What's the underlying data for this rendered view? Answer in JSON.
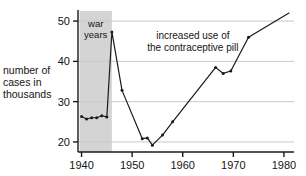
{
  "chart_data": {
    "type": "line",
    "title": "",
    "xlabel": "",
    "ylabel": "number of cases in thousands",
    "ylabel_lines": [
      "number of",
      "cases in",
      "thousands"
    ],
    "xlim": [
      1939.3,
      1981.2
    ],
    "ylim": [
      17.5,
      52.5
    ],
    "xticks": [
      1940,
      1950,
      1960,
      1970,
      1980
    ],
    "xticklabels": [
      "1940",
      "1950",
      "1960",
      "1970",
      "1980"
    ],
    "yticks": [
      20,
      30,
      40,
      50
    ],
    "yticklabels": [
      "20",
      "30",
      "40",
      "50"
    ],
    "grid": "horizontal",
    "legend": "none",
    "markers": true,
    "x": [
      1940,
      1941,
      1942,
      1943,
      1944,
      1945,
      1946,
      1948,
      1952,
      1953,
      1954,
      1956,
      1958,
      1966.5,
      1968,
      1969.5,
      1973,
      1981
    ],
    "values": [
      26.3,
      25.7,
      26.0,
      26.0,
      26.5,
      26.2,
      47.3,
      32.8,
      20.8,
      21.0,
      19.2,
      21.7,
      25.0,
      38.5,
      37.0,
      37.6,
      46.0,
      52.0
    ],
    "annotations": [
      {
        "name": "war-years",
        "lines": [
          "war",
          "years"
        ],
        "x_start": 1939.6,
        "x_end": 1946.0,
        "shading": "#d4d4d4"
      },
      {
        "name": "contraceptive-pill",
        "lines": [
          "increased use of",
          "the contraceptive pill"
        ],
        "x": 1962,
        "y": 45.5
      }
    ],
    "colors": {
      "line": "#1a1a1a",
      "marker": "#1a1a1a",
      "grid": "#c9c9c9",
      "axis": "#1a1a1a",
      "band": "#d4d4d4",
      "background": "#ffffff",
      "text": "#141414"
    }
  }
}
